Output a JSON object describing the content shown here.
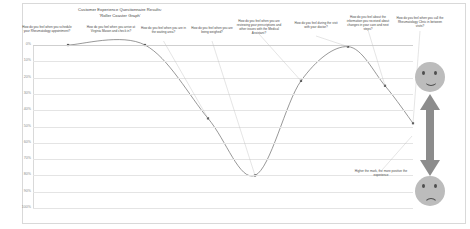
{
  "chart_title": "Customer Experience Questionnaire Results:\n'Roller Coaster Graph'",
  "chart_title_line1": "Customer Experience Questionnaire Results:",
  "chart_title_line2": "'Roller Coaster Graph'",
  "caption_note": "Higher the mark, the more positive the experience",
  "icons": {
    "happy_face": "smiley-happy-icon",
    "sad_face": "smiley-sad-icon",
    "scale_arrow": "double-headed-vertical-arrow-icon"
  },
  "chart_data": {
    "type": "line",
    "title": "Customer Experience Questionnaire Results: 'Roller Coaster Graph'",
    "xlabel": "",
    "ylabel": "",
    "ylim": [
      0,
      100
    ],
    "y_axis_inverted": true,
    "grid": true,
    "legend": "none",
    "ytick_labels": [
      "0%",
      "10%",
      "20%",
      "30%",
      "40%",
      "50%",
      "60%",
      "70%",
      "80%",
      "90%",
      "100%"
    ],
    "ytick_values": [
      0,
      10,
      20,
      30,
      40,
      50,
      60,
      70,
      80,
      90,
      100
    ],
    "categories": [
      "How do you feel when you schedule your Rheumatology appointment?",
      "How do you feel when you arrive at Virginia Mason and check in?",
      "How do you feel when you are in the waiting area?",
      "How do you feel when you are being weighed?",
      "How do you feel when you are reviewing your prescriptions and other issues with the Medical Assistant?",
      "How do you feel during the visit with your doctor?",
      "How do you feel about the information you received about changes in your care and next steps?",
      "How do you feel when you call the Rheumatology Clinic in between visits?"
    ],
    "values": [
      0,
      0,
      45,
      80,
      22,
      1,
      25,
      48
    ],
    "point_labels": [
      "0%",
      "0%",
      "45%",
      "80%",
      "22%",
      "1%",
      "25%",
      "48%"
    ]
  },
  "annotations": [
    {
      "index": 0,
      "text": "How do you feel when you schedule your Rheumatology appointment?"
    },
    {
      "index": 1,
      "text": "How do you feel when you arrive at Virginia Mason and check in?"
    },
    {
      "index": 2,
      "text": "How do you feel when you are in the waiting area?"
    },
    {
      "index": 3,
      "text": "How do you feel when you are being weighed?"
    },
    {
      "index": 4,
      "text": "How do you feel when you are reviewing your prescriptions and other issues with the Medical Assistant?"
    },
    {
      "index": 5,
      "text": "How do you feel during the visit with your doctor?"
    },
    {
      "index": 6,
      "text": "How do you feel about the information you received about changes in your care and next steps?"
    },
    {
      "index": 7,
      "text": "How do you feel when you call the Rheumatology Clinic in between visits?"
    }
  ],
  "colors": {
    "line": "#6b6b6b",
    "grid": "#e4e4e4",
    "text": "#4a4a4a",
    "axis_text": "#8a8a8a",
    "face": "#bcbcbc",
    "arrow": "#8c8c8c",
    "frame": "#d9d9d9"
  }
}
